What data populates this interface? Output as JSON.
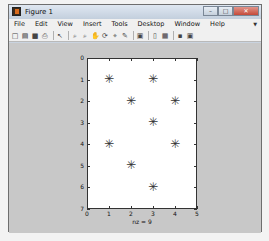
{
  "window": {
    "title": "Figure 1",
    "buttons": {
      "minimize": "–",
      "maximize": "□",
      "close": "✕"
    }
  },
  "menubar": {
    "items": [
      {
        "label": "File"
      },
      {
        "label": "Edit"
      },
      {
        "label": "View"
      },
      {
        "label": "Insert"
      },
      {
        "label": "Tools"
      },
      {
        "label": "Desktop"
      },
      {
        "label": "Window"
      },
      {
        "label": "Help"
      }
    ]
  },
  "toolbar": {
    "icons": [
      {
        "name": "new-figure-icon",
        "glyph": "□"
      },
      {
        "name": "open-file-icon",
        "glyph": "▤"
      },
      {
        "name": "save-icon",
        "glyph": "■"
      },
      {
        "name": "print-icon",
        "glyph": "⎙"
      },
      {
        "name": "edit-plot-icon",
        "glyph": "↖"
      },
      {
        "name": "zoom-in-icon",
        "glyph": "⌕"
      },
      {
        "name": "zoom-out-icon",
        "glyph": "⌕"
      },
      {
        "name": "pan-icon",
        "glyph": "✋"
      },
      {
        "name": "rotate-3d-icon",
        "glyph": "⟳"
      },
      {
        "name": "data-cursor-icon",
        "glyph": "⌖"
      },
      {
        "name": "brush-icon",
        "glyph": "✎"
      },
      {
        "name": "link-plot-icon",
        "glyph": "▣"
      },
      {
        "name": "colorbar-icon",
        "glyph": "▯"
      },
      {
        "name": "legend-icon",
        "glyph": "▦"
      },
      {
        "name": "hide-plot-tools-icon",
        "glyph": "▪"
      },
      {
        "name": "show-plot-tools-icon",
        "glyph": "▣"
      }
    ]
  },
  "chart_data": {
    "type": "scatter",
    "title": "",
    "xlabel": "nz = 9",
    "ylabel": "",
    "xlim": [
      0,
      5
    ],
    "ylim": [
      0,
      7
    ],
    "y_reversed": true,
    "x_ticks": [
      "0",
      "1",
      "2",
      "3",
      "4",
      "5"
    ],
    "y_ticks": [
      "0",
      "1",
      "2",
      "3",
      "4",
      "5",
      "6",
      "7"
    ],
    "marker": "*",
    "grid": false,
    "points": [
      {
        "x": 1,
        "y": 1
      },
      {
        "x": 3,
        "y": 1
      },
      {
        "x": 2,
        "y": 2
      },
      {
        "x": 4,
        "y": 2
      },
      {
        "x": 3,
        "y": 3
      },
      {
        "x": 1,
        "y": 4
      },
      {
        "x": 4,
        "y": 4
      },
      {
        "x": 2,
        "y": 5
      },
      {
        "x": 3,
        "y": 6
      }
    ]
  }
}
